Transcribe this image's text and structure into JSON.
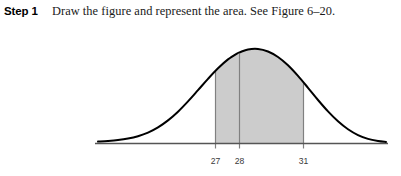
{
  "step": {
    "label": "Step 1",
    "text": "Draw the figure and represent the area. See Figure 6–20."
  },
  "figure": {
    "caption_reference": "Figure 6–20",
    "colors": {
      "curve": "#000000",
      "shade_fill": "#cccccc",
      "axis": "#555555",
      "gridline": "#808080",
      "label": "#3a3a3a"
    }
  },
  "chart_data": {
    "type": "area",
    "title": "",
    "subtitle": "",
    "xlabel": "",
    "ylabel": "",
    "distribution": "normal",
    "mean": 28,
    "shaded_interval": [
      27,
      31
    ],
    "tick_values": [
      27,
      28,
      31
    ],
    "tick_labels": [
      "27",
      "28",
      "31"
    ],
    "tick_x_px": [
      215,
      239,
      303
    ],
    "gridlines": [
      {
        "value": 27,
        "x_px": 215,
        "label": "27",
        "to_curve": true
      },
      {
        "value": 28,
        "x_px": 239,
        "label": "28",
        "to_curve": true
      },
      {
        "value": 31,
        "x_px": 303,
        "label": "31",
        "to_curve": true
      }
    ],
    "axis_range_px": [
      95,
      388
    ],
    "baseline_y_px": 119,
    "peak_y_px": 7,
    "peak_x_px": 240,
    "grid": false,
    "legend": "none",
    "curve_points": [
      [
        98,
        117.6
      ],
      [
        108,
        117.0
      ],
      [
        118,
        116.1
      ],
      [
        128,
        114.6
      ],
      [
        138,
        112.2
      ],
      [
        148,
        108.6
      ],
      [
        158,
        103.4
      ],
      [
        168,
        96.4
      ],
      [
        178,
        87.7
      ],
      [
        188,
        77.4
      ],
      [
        198,
        66.2
      ],
      [
        208,
        54.9
      ],
      [
        218,
        44.3
      ],
      [
        228,
        35.4
      ],
      [
        238,
        29.0
      ],
      [
        240,
        28.2
      ],
      [
        248,
        25.5
      ],
      [
        258,
        25.0
      ],
      [
        268,
        27.5
      ],
      [
        278,
        33.0
      ],
      [
        288,
        41.3
      ],
      [
        298,
        51.9
      ],
      [
        308,
        63.8
      ],
      [
        318,
        76.0
      ],
      [
        328,
        87.4
      ],
      [
        338,
        97.3
      ],
      [
        348,
        105.3
      ],
      [
        358,
        111.1
      ],
      [
        368,
        114.9
      ],
      [
        378,
        117.0
      ],
      [
        386,
        117.9
      ]
    ]
  }
}
